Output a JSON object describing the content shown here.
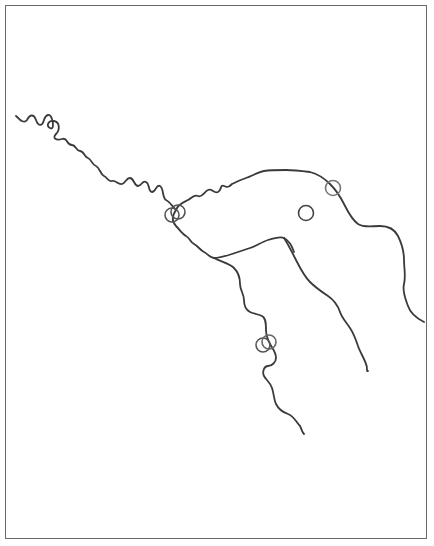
{
  "map": {
    "frame": {
      "x": 5,
      "y": 5,
      "width": 422,
      "height": 534,
      "stroke": "#6a6a6a"
    },
    "river_color": "#3a3a3a",
    "rivers": [
      {
        "name": "main-river-upper-meanders",
        "d": "M16,116 C20,120 24,124 27,120 C30,114 34,114 36,120 C38,126 42,127 44,120 C46,114 50,113 52,119 C54,125 53,130 50,128 C46,126 48,120 54,121 C60,122 60,130 56,134 C52,138 56,141 62,139 C68,137 66,145 72,145 C76,145 76,151 80,151 C84,151 84,157 88,158 C92,160 92,165 96,166 C100,168 100,174 104,176 C108,178 108,182 112,181 C116,180 118,185 122,184 C126,183 126,178 130,178 C134,178 134,186 138,186 C142,186 142,180 146,182 C150,184 148,192 152,192 C156,192 156,184 160,186 C164,188 162,198 166,200 C170,202 172,206 176,210"
      },
      {
        "name": "main-river-north-loop",
        "d": "M176,210 C178,204 184,202 188,200 C192,198 194,194 198,196 C202,198 204,192 208,190 C212,188 214,194 218,192 C222,190 220,184 224,186 C228,188 230,186 232,184 C236,182 240,180 246,178 C252,176 258,172 264,171 C270,170 278,170 286,170 C294,170 302,171 310,172 C318,174 324,178 330,184 C336,190 340,196 344,204 C348,212 352,220 358,224 C364,228 372,226 380,226 C388,226 394,228 398,236 C402,244 404,252 404,260 C404,268 406,276 404,284 C402,292 406,300 408,306 C410,312 416,318 424,322"
      },
      {
        "name": "main-river-south-loop",
        "d": "M176,210 C172,216 172,222 176,226 C180,230 182,234 186,236 C190,238 190,242 194,244 C198,246 200,250 204,252 C208,254 210,258 214,258 C220,258 226,256 232,254 C238,252 244,250 250,248 C256,246 262,242 268,240 C274,238 280,236 284,238 C288,240 292,246 294,252"
      },
      {
        "name": "middle-tributary",
        "d": "M284,238 C288,244 292,252 296,260 C300,268 304,276 310,282 C316,288 322,292 328,296 C334,300 338,306 340,312 C342,318 346,322 350,328 C354,334 356,340 358,346 C360,352 364,358 366,364 C368,368 366,372 368,371"
      },
      {
        "name": "southern-branch",
        "d": "M214,258 C222,262 230,264 234,268 C238,272 240,278 240,284 C240,290 244,294 244,300 C244,306 246,310 250,312 C254,314 258,314 262,316 C266,318 266,324 266,330 C266,336 268,340 270,344 C272,348 276,352 276,358 C276,362 272,366 268,366 C264,366 262,372 264,376 C266,380 270,382 272,388 C274,394 274,400 276,404 C278,408 282,412 288,414 C294,416 296,422 300,426 C302,430 302,432 304,434"
      }
    ],
    "sites": [
      {
        "name": "site-confluence-a",
        "cx": 172,
        "cy": 215,
        "r": 7,
        "stroke": "#555555"
      },
      {
        "name": "site-confluence-b",
        "cx": 178,
        "cy": 212,
        "r": 7,
        "stroke": "#555555"
      },
      {
        "name": "site-northeast-river",
        "cx": 333,
        "cy": 188,
        "r": 7.5,
        "stroke": "#777777"
      },
      {
        "name": "site-inland",
        "cx": 306,
        "cy": 213,
        "r": 7.5,
        "stroke": "#444444"
      },
      {
        "name": "site-southern-a",
        "cx": 263,
        "cy": 345,
        "r": 7,
        "stroke": "#555555"
      },
      {
        "name": "site-southern-b",
        "cx": 269,
        "cy": 342,
        "r": 7,
        "stroke": "#666666"
      }
    ]
  }
}
